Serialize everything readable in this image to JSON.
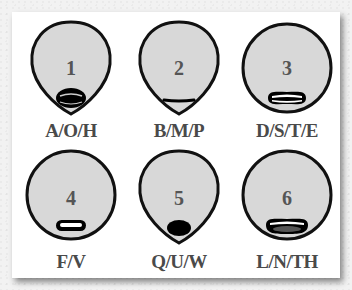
{
  "colors": {
    "face_fill": "#d8d8d8",
    "outline": "#111111",
    "number_text": "#555555",
    "label_text": "#4a4a4a"
  },
  "visemes": [
    {
      "number": "1",
      "label": "A/O/H",
      "mouth": "wide-open-oval"
    },
    {
      "number": "2",
      "label": "B/M/P",
      "mouth": "closed-line"
    },
    {
      "number": "3",
      "label": "D/S/T/E",
      "mouth": "teeth-open-wide"
    },
    {
      "number": "4",
      "label": "F/V",
      "mouth": "narrow-slit"
    },
    {
      "number": "5",
      "label": "Q/U/W",
      "mouth": "small-round-filled"
    },
    {
      "number": "6",
      "label": "L/N/TH",
      "mouth": "tongue-open"
    }
  ]
}
